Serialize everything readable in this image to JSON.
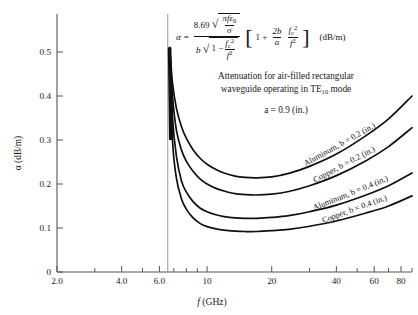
{
  "figure": {
    "background": "#ffffff",
    "ink_color": "#101010",
    "axis_color": "#555555"
  },
  "formula": {
    "lhs": "α",
    "equals": "=",
    "numerator_coefficient": "8.69",
    "numerator_radicand_top": "πfε",
    "numerator_radicand_top_sub": "0",
    "numerator_radicand_bottom": "σ",
    "denominator_leading": "b",
    "denominator_radicand": "1 −",
    "denominator_frac_num": "f",
    "denominator_frac_num_sub": "c",
    "denominator_frac_num_sup": "2",
    "denominator_frac_den": "f",
    "denominator_frac_den_sup": "2",
    "bracket_open": "[",
    "bracket_one": "1 +",
    "bracket_frac1_num": "2b",
    "bracket_frac1_den": "a",
    "bracket_frac2_num": "f",
    "bracket_frac2_num_sub": "c",
    "bracket_frac2_num_sup": "2",
    "bracket_frac2_den": "f",
    "bracket_frac2_den_sup": "2",
    "bracket_close": "]",
    "units": "(dB/m)"
  },
  "notes": {
    "line1": "Attenuation for air-filled rectangular",
    "line2_pre": "waveguide operating in TE",
    "line2_sub": "10",
    "line2_post": " mode",
    "parameter_a": "a = 0.9 (in.)"
  },
  "chart_data": {
    "type": "line",
    "title": "Attenuation for air-filled rectangular waveguide operating in TE10 mode",
    "xlabel": "f (GHz)",
    "ylabel": "α (dB/m)",
    "xscale": "log",
    "yscale": "linear",
    "xlim": [
      2.0,
      90
    ],
    "ylim": [
      0,
      0.56
    ],
    "grid": false,
    "legend": "inline-curve-labels",
    "xticks_major": [
      "2.0",
      "4.0",
      "6.0",
      "10",
      "20",
      "40",
      "60",
      "80"
    ],
    "xtick_major_values": [
      2.0,
      4.0,
      6.0,
      10,
      20,
      40,
      60,
      80
    ],
    "xticks_minor_values": [
      3.0,
      5.0,
      7.0,
      8.0,
      9.0,
      30,
      50,
      70,
      90
    ],
    "yticks": [
      "0",
      "0.1",
      "0.2",
      "0.3",
      "0.4",
      "0.5"
    ],
    "ytick_values": [
      0,
      0.1,
      0.2,
      0.3,
      0.4,
      0.5
    ],
    "cutoff_frequency_ghz": 6.56,
    "cutoff_annotation": "vertical line at f_c = 6.56 GHz",
    "series": [
      {
        "name": "Aluminum, b = 0.2 (in.)",
        "label": "Aluminum, b = 0.2 (in.)",
        "x": [
          6.7,
          6.9,
          7.2,
          7.6,
          8.0,
          8.6,
          9.3,
          10.0,
          11.0,
          12.0,
          13.5,
          15.0,
          17.0,
          20.0,
          24.0,
          30.0,
          40.0,
          55.0,
          70.0,
          90.0
        ],
        "y": [
          0.51,
          0.43,
          0.372,
          0.33,
          0.304,
          0.278,
          0.258,
          0.245,
          0.233,
          0.225,
          0.218,
          0.215,
          0.214,
          0.216,
          0.224,
          0.24,
          0.268,
          0.31,
          0.348,
          0.4
        ]
      },
      {
        "name": "Copper, b = 0.2 (in.)",
        "label": "Copper, b = 0.2 (in.)",
        "x": [
          6.7,
          6.9,
          7.2,
          7.6,
          8.0,
          8.6,
          9.3,
          10.0,
          11.0,
          12.0,
          13.5,
          15.0,
          17.0,
          20.0,
          24.0,
          30.0,
          40.0,
          55.0,
          70.0,
          90.0
        ],
        "y": [
          0.51,
          0.4,
          0.322,
          0.277,
          0.252,
          0.229,
          0.211,
          0.2,
          0.19,
          0.184,
          0.178,
          0.176,
          0.175,
          0.177,
          0.183,
          0.196,
          0.219,
          0.253,
          0.285,
          0.328
        ]
      },
      {
        "name": "Aluminum, b = 0.4 (in.)",
        "label": "Aluminum, b = 0.4 (in.)",
        "x": [
          6.7,
          6.9,
          7.2,
          7.6,
          8.0,
          8.6,
          9.3,
          10.0,
          11.0,
          12.0,
          13.5,
          15.0,
          17.0,
          20.0,
          24.0,
          30.0,
          40.0,
          55.0,
          70.0,
          90.0
        ],
        "y": [
          0.51,
          0.352,
          0.262,
          0.207,
          0.182,
          0.16,
          0.145,
          0.137,
          0.13,
          0.126,
          0.123,
          0.122,
          0.122,
          0.124,
          0.128,
          0.137,
          0.152,
          0.175,
          0.196,
          0.225
        ]
      },
      {
        "name": "Copper, b = 0.4 (in.)",
        "label": "Copper, b = 0.4 (in.)",
        "x": [
          6.7,
          6.9,
          7.2,
          7.6,
          8.0,
          8.6,
          9.3,
          10.0,
          11.0,
          12.0,
          13.5,
          15.0,
          17.0,
          20.0,
          24.0,
          30.0,
          40.0,
          55.0,
          70.0,
          90.0
        ],
        "y": [
          0.51,
          0.3,
          0.213,
          0.166,
          0.143,
          0.123,
          0.11,
          0.103,
          0.098,
          0.095,
          0.093,
          0.092,
          0.092,
          0.094,
          0.097,
          0.104,
          0.116,
          0.134,
          0.15,
          0.173
        ]
      }
    ]
  },
  "axes": {
    "x_title": "f (GHz)",
    "x_title_italic": "f",
    "x_title_rest": " (GHz)",
    "y_title": "α (dB/m)"
  }
}
